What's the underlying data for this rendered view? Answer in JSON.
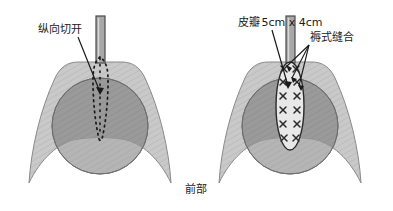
{
  "figure": {
    "caption": "前部",
    "background_color": "#ffffff",
    "panels": [
      {
        "id": "left",
        "name": "incision-panel",
        "center_x": 100,
        "labels": [
          {
            "name": "incision-label",
            "text": "纵向切开",
            "x": 38,
            "y": 33,
            "leader": {
              "x1": 78,
              "y1": 37,
              "x2": 101,
              "y2": 94
            }
          }
        ],
        "instrument": {
          "name": "catheter-bar",
          "x": 96,
          "y": 16,
          "width": 9,
          "height": 47,
          "fill": "#a8a8a8",
          "stroke": "#4a4a4a"
        },
        "incision": {
          "name": "dotted-incision-outline",
          "dot_color": "#1a1a1a",
          "top_y": 57,
          "bottom_y": 140,
          "half_width": 7
        }
      },
      {
        "id": "right",
        "name": "flap-suture-panel",
        "center_x": 290,
        "labels": [
          {
            "name": "flap-label",
            "text": "皮瓣",
            "value": "5cm x 4cm",
            "x": 215,
            "y": 26,
            "leader": {
              "x1": 272,
              "y1": 30,
              "x2": 288,
              "y2": 88
            }
          },
          {
            "name": "mattress-suture-label",
            "text": "褥式缝合",
            "x": 311,
            "y": 40,
            "leaders": [
              {
                "x1": 309,
                "y1": 44,
                "x2": 288,
                "y2": 67
              },
              {
                "x1": 309,
                "y1": 44,
                "x2": 292,
                "y2": 78
              },
              {
                "x1": 309,
                "y1": 44,
                "x2": 297,
                "y2": 85
              }
            ]
          }
        ],
        "instrument": {
          "name": "catheter-bar",
          "x": 286,
          "y": 16,
          "width": 9,
          "height": 47,
          "fill": "#a8a8a8",
          "stroke": "#4a4a4a"
        },
        "flap": {
          "name": "skin-flap-oval",
          "cx": 290,
          "cy": 106,
          "rx": 14,
          "ry": 44,
          "fill": "#e8e8e8",
          "stroke": "#2a2a2a"
        },
        "sutures": {
          "name": "mattress-suture-marks",
          "glyph": "x",
          "color": "#2a2a2a",
          "left_column_x": 283,
          "right_column_x": 297,
          "rows_y": [
            82,
            96,
            110,
            124,
            138
          ],
          "top_marks": [
            {
              "x": 283,
              "y": 70
            },
            {
              "x": 297,
              "y": 70
            }
          ]
        }
      }
    ],
    "anatomy": {
      "saddle_shape": {
        "name": "tissue-saddle-shape",
        "fill": "#c9c9c9",
        "stroke": "#8a8a8a",
        "hatch_color": "#bdbdbd"
      },
      "circle_shape": {
        "name": "tissue-circle-shape",
        "fill": "#9a9a9a",
        "stroke": "#6e6e6e",
        "lower_fill": "#b5b5b5",
        "cx_offset": 0,
        "cy": 126,
        "r": 48
      }
    },
    "colors": {
      "light_gray": "#c9c9c9",
      "mid_gray": "#9a9a9a",
      "lower_gray": "#b5b5b5",
      "outline": "#6e6e6e",
      "text": "#1a1a1a"
    }
  }
}
